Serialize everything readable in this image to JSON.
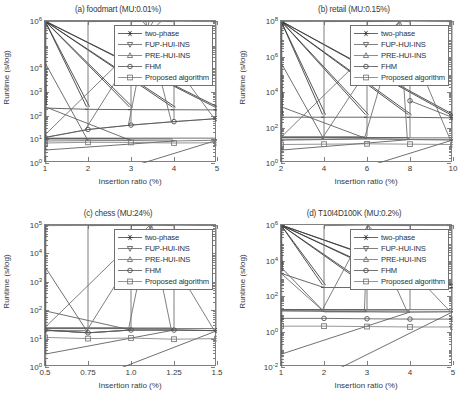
{
  "figure": {
    "axis_label_y": "Runtime (s/log)",
    "axis_label_x": "Insertion ratio (%)",
    "series_colors": [
      "#404040",
      "#606060",
      "#707070",
      "#505050",
      "#7a7a7a"
    ]
  },
  "legend_labels": {
    "two_phase": "two-phase",
    "fup": "FUP-HUI-INS",
    "pre": "PRE-HUI-INS",
    "fhm": "FHM",
    "proposed": "Proposed algorithm"
  },
  "chart_data": [
    {
      "type": "line",
      "panel": "a",
      "title": "(a) foodmart (MU:0.01%)",
      "xlabel": "Insertion ratio (%)",
      "ylabel": "Runtime (s/log)",
      "xlim": [
        1,
        5
      ],
      "ylim": [
        1,
        1000000
      ],
      "yscale": "log",
      "ytick_labels": [
        "10",
        "10",
        "10",
        "10",
        "10",
        "10"
      ],
      "ytick_exponents": [
        "0",
        "1",
        "2",
        "3",
        "4",
        "6"
      ],
      "yticks": [
        1,
        10,
        100,
        1000,
        10000,
        1000000
      ],
      "xticks": [
        1,
        2,
        3,
        4,
        5
      ],
      "xtick_labels": [
        "1",
        "2",
        "3",
        "4",
        "5"
      ],
      "grid": false,
      "legend_position": "upper right",
      "series": [
        {
          "name": "two-phase",
          "marker": "star",
          "x": [
            1,
            2,
            3,
            4,
            5
          ],
          "values": [
            210,
            185,
            180,
            178,
            175
          ]
        },
        {
          "name": "FUP-HUI-INS",
          "marker": "triangle-down",
          "x": [
            1,
            2,
            3,
            4,
            5
          ],
          "values": [
            8.5,
            8.8,
            8.9,
            8.5,
            9.2
          ]
        },
        {
          "name": "PRE-HUI-INS",
          "marker": "triangle-up",
          "x": [
            1,
            2,
            3,
            4,
            5
          ],
          "values": [
            12,
            26,
            40,
            56,
            75
          ]
        },
        {
          "name": "FHM",
          "marker": "circle",
          "x": [
            1,
            2,
            3,
            4,
            5
          ],
          "values": [
            12,
            26,
            40,
            56,
            75
          ]
        },
        {
          "name": "Proposed algorithm",
          "marker": "square",
          "x": [
            1,
            2,
            3,
            4,
            5
          ],
          "values": [
            7.0,
            7.5,
            7.4,
            7.0,
            7.2
          ]
        }
      ]
    },
    {
      "type": "line",
      "panel": "b",
      "title": "(b) retail (MU:0.15%)",
      "xlabel": "Insertion ratio (%)",
      "ylabel": "Runtime (s/log)",
      "xlim": [
        2,
        10
      ],
      "ylim": [
        1,
        100000000
      ],
      "yscale": "log",
      "ytick_labels": [
        "10",
        "10",
        "10",
        "10",
        "10"
      ],
      "ytick_exponents": [
        "0",
        "2",
        "4",
        "6",
        "8"
      ],
      "yticks": [
        1,
        100,
        10000,
        1000000,
        100000000
      ],
      "xticks": [
        2,
        4,
        6,
        8,
        10
      ],
      "xtick_labels": [
        "2",
        "4",
        "6",
        "8",
        "10"
      ],
      "grid": false,
      "legend_position": "upper right",
      "series": [
        {
          "name": "two-phase",
          "marker": "star",
          "x": [
            2,
            4,
            6,
            8,
            10
          ],
          "values": [
            380,
            380,
            380,
            375,
            350
          ]
        },
        {
          "name": "FUP-HUI-INS",
          "marker": "triangle-down",
          "x": [
            2,
            4,
            6,
            8,
            10
          ],
          "values": [
            20,
            21,
            23,
            21,
            20
          ]
        },
        {
          "name": "PRE-HUI-INS",
          "marker": "triangle-up",
          "x": [
            2,
            4,
            6,
            8,
            10
          ],
          "values": [
            20,
            21,
            23,
            21,
            20
          ]
        },
        {
          "name": "FHM",
          "marker": "circle",
          "x": [
            8,
            10
          ],
          "values": [
            3200,
            360
          ]
        },
        {
          "name": "Proposed algorithm",
          "marker": "square",
          "x": [
            2,
            4,
            6,
            8,
            10
          ],
          "values": [
            11,
            11.5,
            12,
            11.5,
            11
          ]
        }
      ]
    },
    {
      "type": "line",
      "panel": "c",
      "title": "(c) chess (MU:24%)",
      "xlabel": "Insertion ratio (%)",
      "ylabel": "Runtime (s/log)",
      "xlim": [
        0.5,
        1.5
      ],
      "ylim": [
        1,
        100000
      ],
      "yscale": "log",
      "ytick_labels": [
        "10",
        "10",
        "10",
        "10",
        "10",
        "10"
      ],
      "ytick_exponents": [
        "0",
        "1",
        "2",
        "3",
        "4",
        "5"
      ],
      "yticks": [
        1,
        10,
        100,
        1000,
        10000,
        100000
      ],
      "xticks": [
        0.5,
        0.75,
        1.0,
        1.25,
        1.5
      ],
      "xtick_labels": [
        "0.5",
        "0.75",
        "1.0",
        "1.25",
        "1.5"
      ],
      "grid": false,
      "legend_position": "upper right",
      "series": [
        {
          "name": "two-phase",
          "marker": "star",
          "x": [],
          "values": []
        },
        {
          "name": "FUP-HUI-INS",
          "marker": "triangle-down",
          "x": [
            0.5,
            0.75,
            1.0,
            1.25,
            1.5
          ],
          "values": [
            20,
            16,
            20,
            20,
            19
          ]
        },
        {
          "name": "PRE-HUI-INS",
          "marker": "triangle-up",
          "x": [
            0.5,
            0.75,
            1.0,
            1.25,
            1.5
          ],
          "values": [
            20,
            16,
            20,
            20,
            19
          ]
        },
        {
          "name": "FHM",
          "marker": "circle",
          "x": [
            0.5,
            0.75,
            1.0,
            1.25,
            1.5
          ],
          "values": [
            20,
            16,
            20,
            20,
            19
          ]
        },
        {
          "name": "Proposed algorithm",
          "marker": "square",
          "x": [
            0.5,
            0.75,
            1.0,
            1.25,
            1.5
          ],
          "values": [
            11,
            10,
            10.5,
            9.5,
            10
          ]
        }
      ]
    },
    {
      "type": "line",
      "panel": "d",
      "title": "(d) T10I4D100K (MU:0.2%)",
      "xlabel": "Insertion ratio (%)",
      "ylabel": "Runtime (s/log)",
      "xlim": [
        1,
        5
      ],
      "ylim": [
        0.01,
        1000000
      ],
      "yscale": "log",
      "ytick_labels": [
        "10",
        "10",
        "10",
        "10",
        "10"
      ],
      "ytick_exponents": [
        "-2",
        "0",
        "2",
        "4",
        "6"
      ],
      "yticks": [
        0.01,
        1,
        100,
        10000,
        1000000
      ],
      "xticks": [
        1,
        2,
        3,
        4,
        5
      ],
      "xtick_labels": [
        "1",
        "2",
        "3",
        "4",
        "5"
      ],
      "grid": false,
      "legend_position": "upper right",
      "series": [
        {
          "name": "two-phase",
          "marker": "star",
          "x": [
            1,
            2,
            3,
            4,
            5
          ],
          "values": [
            1900,
            300,
            300,
            295,
            295
          ]
        },
        {
          "name": "FUP-HUI-INS",
          "marker": "triangle-down",
          "x": [
            1,
            2,
            3,
            4,
            5
          ],
          "values": [
            1900,
            13,
            13,
            12.5,
            13
          ]
        },
        {
          "name": "PRE-HUI-INS",
          "marker": "triangle-up",
          "x": [
            2,
            3,
            4,
            5
          ],
          "values": [
            13,
            13,
            12.5,
            13
          ]
        },
        {
          "name": "FHM",
          "marker": "circle",
          "x": [
            1,
            2,
            3,
            4,
            5
          ],
          "values": [
            5.5,
            5.5,
            5.2,
            5.0,
            5.0
          ]
        },
        {
          "name": "Proposed algorithm",
          "marker": "square",
          "x": [
            1,
            2,
            3,
            4,
            5
          ],
          "values": [
            2.0,
            2.0,
            1.9,
            1.8,
            1.8
          ]
        }
      ]
    }
  ]
}
